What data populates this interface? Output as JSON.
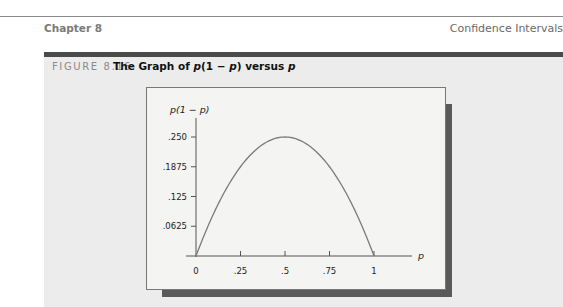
{
  "header": {
    "chapter": "Chapter 8",
    "section": "Confidence Intervals"
  },
  "figure": {
    "label": "FIGURE 8.16",
    "title_prefix": "The Graph of ",
    "title_expr_a": "p",
    "title_expr_b": "(1 − ",
    "title_expr_c": "p",
    "title_expr_d": ") versus ",
    "title_expr_e": "p"
  },
  "chart_data": {
    "type": "line",
    "title": "The Graph of p(1 − p) versus p",
    "xlabel": "p",
    "ylabel": "p(1 − p)",
    "x_ticks": [
      "0",
      ".25",
      ".5",
      ".75",
      "1"
    ],
    "y_ticks": [
      ".0625",
      ".125",
      ".1875",
      ".250"
    ],
    "xlim": [
      0,
      1
    ],
    "ylim": [
      0,
      0.25
    ],
    "grid": false,
    "series": [
      {
        "name": "p(1 − p)",
        "x": [
          0,
          0.1,
          0.2,
          0.25,
          0.3,
          0.4,
          0.5,
          0.6,
          0.7,
          0.75,
          0.8,
          0.9,
          1.0
        ],
        "values": [
          0,
          0.09,
          0.16,
          0.1875,
          0.21,
          0.24,
          0.25,
          0.24,
          0.21,
          0.1875,
          0.16,
          0.09,
          0
        ]
      }
    ],
    "color": "#7a7a7a"
  }
}
